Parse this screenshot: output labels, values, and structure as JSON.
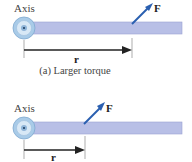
{
  "panels": [
    {
      "axis_label": "Axis",
      "force_label": "F⃗",
      "radius_label": "r⃗",
      "caption": "(a) Larger torque",
      "force_point_x": 132,
      "radius_end_x": 132
    },
    {
      "axis_label": "Axis",
      "force_label": "F⃗",
      "radius_label": "r⃗",
      "caption": "",
      "force_point_x": 84,
      "radius_end_x": 84
    }
  ],
  "colors": {
    "bar": "#b8bfe6",
    "bar_edge": "#9aa2d2",
    "force_arrow": "#2a5fb0",
    "radius_arrow": "#222222",
    "pivot_outer": "#a9cbe8",
    "pivot_inner": "#d8e8f6"
  }
}
